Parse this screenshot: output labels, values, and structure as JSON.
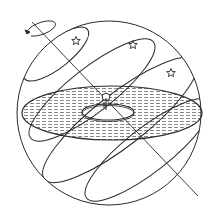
{
  "diagram": {
    "colors": {
      "background": "#ffffff",
      "stroke": "#2a2a2a",
      "hatch": "#6a6a6a",
      "disc_fill": "#e4e4e4"
    },
    "sphere": {
      "cx": 109,
      "cy": 113,
      "r": 92
    },
    "horizon_disc": {
      "cx": 112,
      "cy": 113,
      "rx": 90,
      "ry": 27,
      "pattern": "dashed-hatch"
    },
    "observer_island": {
      "cx": 108,
      "cy": 112,
      "rx": 26,
      "ry": 8
    },
    "observer": {
      "x": 106,
      "y": 104,
      "label": "observer-figure"
    },
    "axis": {
      "x1": 32,
      "y1": 22,
      "x2": 198,
      "y2": 196
    },
    "rotation_arrow": {
      "cx": 40,
      "cy": 30,
      "rx": 15,
      "ry": 6,
      "direction": "counter-clockwise"
    },
    "star_paths": [
      {
        "name": "path-1",
        "cx": 56,
        "cy": 54,
        "rx": 40,
        "ry": 14,
        "rotate": -38
      },
      {
        "name": "path-2",
        "cx": 92,
        "cy": 90,
        "rx": 78,
        "ry": 22,
        "rotate": -38
      },
      {
        "name": "path-3",
        "cx": 120,
        "cy": 120,
        "rx": 96,
        "ry": 26,
        "rotate": -38
      },
      {
        "name": "path-4",
        "cx": 148,
        "cy": 150,
        "rx": 78,
        "ry": 22,
        "rotate": -38
      }
    ],
    "stars": [
      {
        "name": "star-1",
        "x": 76,
        "y": 41
      },
      {
        "name": "star-2",
        "x": 133,
        "y": 45
      },
      {
        "name": "star-3",
        "x": 171,
        "y": 73
      }
    ]
  }
}
